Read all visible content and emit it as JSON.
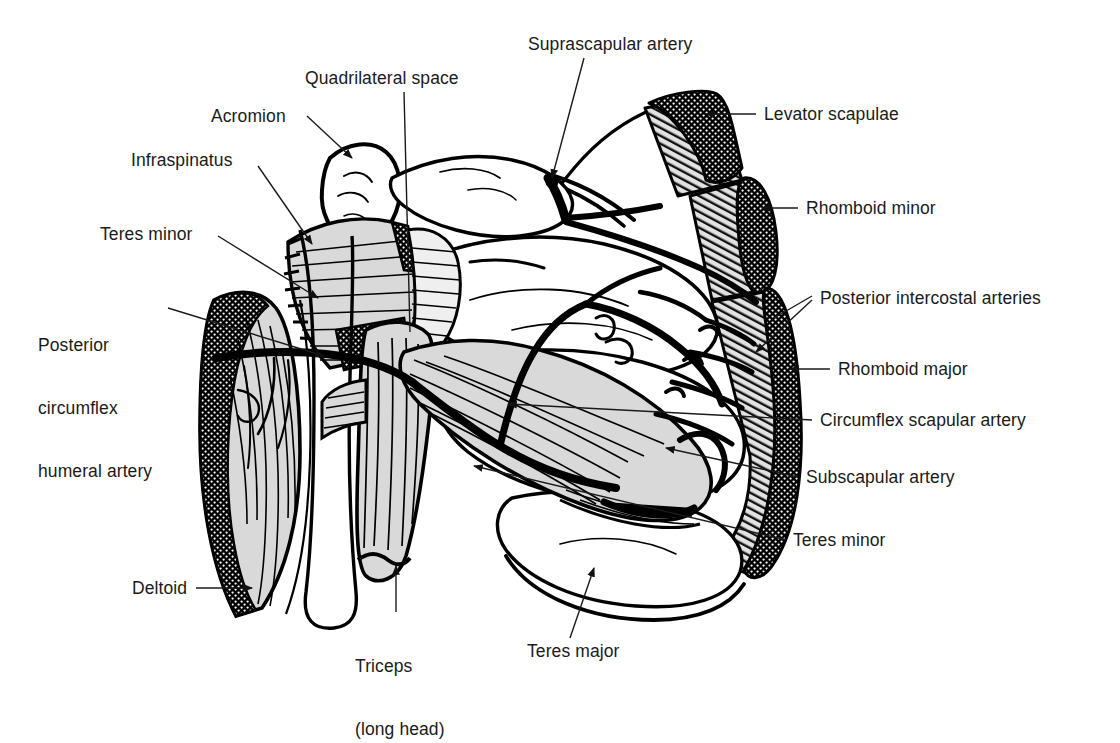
{
  "figure": {
    "type": "anatomical-line-diagram",
    "background_color": "#ffffff",
    "ink_color": "#000000",
    "muscle_fill_color": "#d9d9d9",
    "cut_end_color": "#000000"
  },
  "labels": [
    {
      "id": "suprascapular-artery",
      "text": "Suprascapular artery",
      "x": 528,
      "y": 34,
      "side": "top",
      "leader": "line"
    },
    {
      "id": "quadrilateral-space",
      "text": "Quadrilateral space",
      "x": 305,
      "y": 68,
      "side": "top",
      "leader": "line"
    },
    {
      "id": "acromion",
      "text": "Acromion",
      "x": 211,
      "y": 106,
      "side": "left",
      "leader": "arrow"
    },
    {
      "id": "levator-scapulae",
      "text": "Levator scapulae",
      "x": 764,
      "y": 104,
      "side": "right",
      "leader": "arrow"
    },
    {
      "id": "infraspinatus",
      "text": "Infraspinatus",
      "x": 131,
      "y": 150,
      "side": "left",
      "leader": "arrow"
    },
    {
      "id": "rhomboid-minor",
      "text": "Rhomboid minor",
      "x": 806,
      "y": 198,
      "side": "right",
      "leader": "arrow"
    },
    {
      "id": "teres-minor-left",
      "text": "Teres minor",
      "x": 100,
      "y": 224,
      "side": "left",
      "leader": "arrow"
    },
    {
      "id": "posterior-intercostal-arteries",
      "text": "Posterior intercostal arteries",
      "x": 820,
      "y": 288,
      "side": "right",
      "leader": "line"
    },
    {
      "id": "posterior-circumflex-humeral-artery",
      "text": "Posterior\ncirculflex\nhumeral artery",
      "x": 38,
      "y": 293,
      "side": "left",
      "leader": "arrow",
      "lines": [
        "Posterior",
        "circumflex",
        "humeral artery"
      ]
    },
    {
      "id": "rhomboid-major",
      "text": "Rhomboid major",
      "x": 838,
      "y": 359,
      "side": "right",
      "leader": "arrow"
    },
    {
      "id": "circumflex-scapular-artery",
      "text": "Circumflex scapular artery",
      "x": 820,
      "y": 415,
      "side": "right",
      "leader": "line"
    },
    {
      "id": "subscapular-artery",
      "text": "Subscapular artery",
      "x": 806,
      "y": 469,
      "side": "right",
      "leader": "line"
    },
    {
      "id": "teres-minor-right",
      "text": "Teres minor",
      "x": 793,
      "y": 534,
      "side": "right",
      "leader": "line"
    },
    {
      "id": "deltoid",
      "text": "Deltoid",
      "x": 132,
      "y": 578,
      "side": "left",
      "leader": "arrow"
    },
    {
      "id": "triceps-long-head",
      "text": "Triceps\n(long head)",
      "x": 355,
      "y": 618,
      "side": "bottom",
      "leader": "arrow",
      "lines": [
        "Triceps",
        "(long head)"
      ]
    },
    {
      "id": "teres-major",
      "text": "Teres major",
      "x": 527,
      "y": 645,
      "side": "bottom",
      "leader": "line"
    }
  ],
  "structures": {
    "bones": [
      "scapula",
      "acromion",
      "spine-of-scapula",
      "humerus-shaft"
    ],
    "muscles": [
      "deltoid",
      "infraspinatus",
      "teres-minor",
      "teres-major",
      "triceps-long-head",
      "levator-scapulae",
      "rhomboid-minor",
      "rhomboid-major"
    ],
    "arteries": [
      "suprascapular-artery",
      "posterior-circumflex-humeral-artery",
      "circumflex-scapular-artery",
      "subscapular-artery",
      "posterior-intercostal-arteries"
    ],
    "spaces": [
      "quadrilateral-space"
    ]
  }
}
